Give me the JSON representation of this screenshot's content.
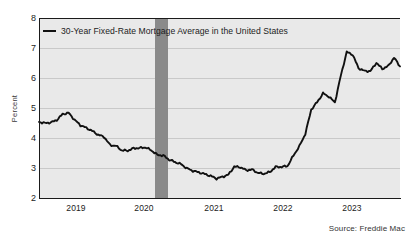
{
  "chart_data": {
    "type": "line",
    "title": "",
    "xlabel": "",
    "ylabel": "Percent",
    "ylim": [
      2,
      8
    ],
    "yticks": [
      2,
      3,
      4,
      5,
      6,
      7,
      8
    ],
    "xticks": [
      "2019",
      "2020",
      "2021",
      "2022",
      "2023"
    ],
    "xlim": [
      "2018-06",
      "2023-08"
    ],
    "grid": true,
    "legend_position": "top-left",
    "legend": [
      "30-Year Fixed-Rate Mortgage Average in the United States"
    ],
    "line_color": "#111111",
    "plot_background": "#e9e9e9",
    "gridline_color": "#c9c9c9",
    "recession_band": {
      "label": "recession-shading",
      "color": "#8a8a8a",
      "start": "2020-02",
      "end": "2020-04"
    },
    "source": "Source: Freddie Mac",
    "series": [
      {
        "name": "30-Year Fixed-Rate Mortgage Average in the United States",
        "x": [
          "2018-06",
          "2018-07",
          "2018-08",
          "2018-09",
          "2018-10",
          "2018-11",
          "2018-12",
          "2019-01",
          "2019-02",
          "2019-03",
          "2019-04",
          "2019-05",
          "2019-06",
          "2019-07",
          "2019-08",
          "2019-09",
          "2019-10",
          "2019-11",
          "2019-12",
          "2020-01",
          "2020-02",
          "2020-03",
          "2020-04",
          "2020-05",
          "2020-06",
          "2020-07",
          "2020-08",
          "2020-09",
          "2020-10",
          "2020-11",
          "2020-12",
          "2021-01",
          "2021-02",
          "2021-03",
          "2021-04",
          "2021-05",
          "2021-06",
          "2021-07",
          "2021-08",
          "2021-09",
          "2021-10",
          "2021-11",
          "2021-12",
          "2022-01",
          "2022-02",
          "2022-03",
          "2022-04",
          "2022-05",
          "2022-06",
          "2022-07",
          "2022-08",
          "2022-09",
          "2022-10",
          "2022-11",
          "2022-12",
          "2023-01",
          "2023-02",
          "2023-03",
          "2023-04",
          "2023-05",
          "2023-06",
          "2023-07"
        ],
        "values": [
          4.57,
          4.53,
          4.55,
          4.63,
          4.83,
          4.87,
          4.64,
          4.46,
          4.37,
          4.27,
          4.14,
          4.07,
          3.8,
          3.77,
          3.62,
          3.61,
          3.69,
          3.7,
          3.72,
          3.62,
          3.47,
          3.45,
          3.31,
          3.23,
          3.16,
          3.02,
          2.94,
          2.89,
          2.83,
          2.77,
          2.68,
          2.74,
          2.81,
          3.08,
          3.06,
          2.96,
          2.98,
          2.87,
          2.84,
          2.9,
          3.07,
          3.07,
          3.1,
          3.45,
          3.76,
          4.17,
          4.98,
          5.23,
          5.52,
          5.41,
          5.22,
          6.11,
          6.9,
          6.81,
          6.36,
          6.27,
          6.26,
          6.54,
          6.34,
          6.43,
          6.71,
          6.42
        ]
      }
    ],
    "annotations": {
      "peak_value": 7.0,
      "peak_period": "2022-11",
      "trough_value": 2.65,
      "trough_period": "2020-12",
      "start_value": 4.57,
      "end_value": 6.4
    }
  },
  "axis": {
    "y_label": "Percent",
    "y_ticks": [
      "8",
      "7",
      "6",
      "5",
      "4",
      "3",
      "2"
    ],
    "x_ticks": [
      "2019",
      "2020",
      "2021",
      "2022",
      "2023"
    ]
  },
  "legend": {
    "entries": [
      {
        "label": "30-Year Fixed-Rate Mortgage Average in the United States"
      }
    ]
  },
  "footer": {
    "source": "Source: Freddie Mac"
  }
}
